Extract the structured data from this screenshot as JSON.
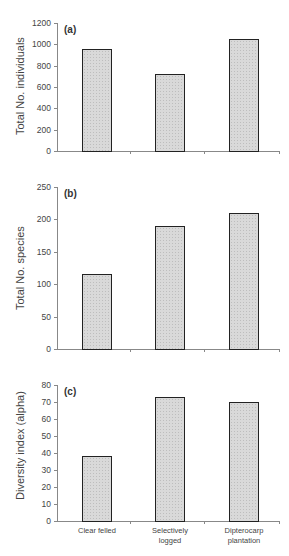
{
  "chart_data": [
    {
      "type": "bar",
      "panel_label": "(a)",
      "categories": [
        "Clear felled",
        "Selectively logged",
        "Dipterocarp plantation"
      ],
      "values": [
        960,
        720,
        1050
      ],
      "title": "",
      "xlabel": "",
      "ylabel": "Total No. individuals",
      "ylim": [
        0,
        1200
      ],
      "yticks": [
        0,
        200,
        400,
        600,
        800,
        1000,
        1200
      ],
      "grid": false
    },
    {
      "type": "bar",
      "panel_label": "(b)",
      "categories": [
        "Clear felled",
        "Selectively logged",
        "Dipterocarp plantation"
      ],
      "values": [
        115,
        190,
        210
      ],
      "title": "",
      "xlabel": "",
      "ylabel": "Total No. species",
      "ylim": [
        0,
        250
      ],
      "yticks": [
        0,
        50,
        100,
        150,
        200,
        250
      ],
      "grid": false
    },
    {
      "type": "bar",
      "panel_label": "(c)",
      "categories": [
        "Clear felled",
        "Selectively logged",
        "Dipterocarp plantation"
      ],
      "values": [
        38,
        73,
        70
      ],
      "title": "",
      "xlabel": "",
      "ylabel": "Diversity index (alpha)",
      "ylim": [
        0,
        80
      ],
      "yticks": [
        0,
        10,
        20,
        30,
        40,
        50,
        60,
        70,
        80
      ],
      "grid": false
    }
  ],
  "x_category_labels": [
    [
      "Clear felled"
    ],
    [
      "Selectively",
      "logged"
    ],
    [
      "Dipterocarp",
      "plantation"
    ]
  ],
  "colors": {
    "bar_fill": "#d9d9d9",
    "bar_border": "#222222",
    "axis": "#888888"
  }
}
